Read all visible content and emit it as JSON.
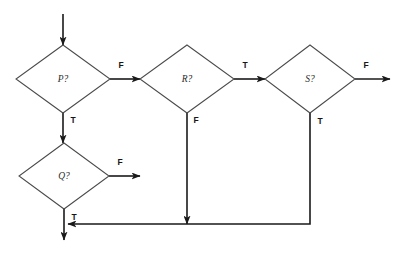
{
  "diagram": {
    "type": "flowchart",
    "canvas": {
      "width": 400,
      "height": 262
    },
    "colors": {
      "background": "#ffffff",
      "edge_stroke": "#1a1a1a",
      "node_stroke": "#4a4a4a",
      "node_fill": "#ffffff",
      "label_text": "#2b2b2b"
    },
    "nodes": [
      {
        "id": "p",
        "label": "P?",
        "shape": "diamond",
        "center_x": 63,
        "center_y": 79,
        "half_width": 47,
        "half_height": 34
      },
      {
        "id": "q",
        "label": "Q?",
        "shape": "diamond",
        "center_x": 64,
        "center_y": 176,
        "half_width": 45,
        "half_height": 33
      },
      {
        "id": "r",
        "label": "R?",
        "shape": "diamond",
        "center_x": 187,
        "center_y": 79,
        "half_width": 47,
        "half_height": 34
      },
      {
        "id": "s",
        "label": "S?",
        "shape": "diamond",
        "center_x": 310,
        "center_y": 79,
        "half_width": 45,
        "half_height": 34
      }
    ],
    "edges": [
      {
        "id": "entry-to-p",
        "from": "start",
        "to": "p",
        "label": "",
        "label_x": 0,
        "label_y": 0,
        "path": "M 63 14 L 63 45",
        "arrow_at": "end"
      },
      {
        "id": "p-false-to-r",
        "from": "p",
        "to": "r",
        "label": "F",
        "label_x": 121,
        "label_y": 66,
        "path": "M 110 79 L 140 79",
        "arrow_at": "end"
      },
      {
        "id": "p-true-to-q",
        "from": "p",
        "to": "q",
        "label": "T",
        "label_x": 73,
        "label_y": 121,
        "path": "M 63 113 L 63 143",
        "arrow_at": "end"
      },
      {
        "id": "q-false-exit",
        "from": "q",
        "to": "exit-right",
        "label": "F",
        "label_x": 120,
        "label_y": 163,
        "path": "M 109 176 L 140 176",
        "arrow_at": "end"
      },
      {
        "id": "q-true-exit",
        "from": "q",
        "to": "exit-bottom",
        "label": "T",
        "label_x": 74,
        "label_y": 218,
        "path": "M 64 209 L 64 240",
        "arrow_at": "end"
      },
      {
        "id": "r-true-to-s",
        "from": "r",
        "to": "s",
        "label": "T",
        "label_x": 245,
        "label_y": 66,
        "path": "M 234 79 L 265 79",
        "arrow_at": "end"
      },
      {
        "id": "r-false-to-join",
        "from": "r",
        "to": "join",
        "label": "F",
        "label_x": 196,
        "label_y": 121,
        "path": "M 187 113 L 187 224",
        "arrow_at": "end"
      },
      {
        "id": "s-false-exit",
        "from": "s",
        "to": "exit-right-2",
        "label": "F",
        "label_x": 366,
        "label_y": 66,
        "path": "M 355 79 L 390 79",
        "arrow_at": "end"
      },
      {
        "id": "s-true-to-join",
        "from": "s",
        "to": "join",
        "label": "T",
        "label_x": 320,
        "label_y": 122,
        "path": "M 310 112 L 310 224 L 68 224",
        "arrow_at": "end"
      }
    ]
  }
}
